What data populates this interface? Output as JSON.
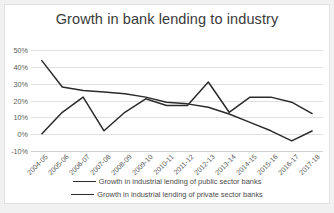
{
  "chart_data": {
    "type": "line",
    "title": "Growth in bank lending to industry",
    "xlabel": "",
    "ylabel": "",
    "ylim": [
      -10,
      50
    ],
    "yticks": [
      "-10%",
      "0%",
      "10%",
      "20%",
      "30%",
      "40%",
      "50%"
    ],
    "ytick_values": [
      -10,
      0,
      10,
      20,
      30,
      40,
      50
    ],
    "grid": true,
    "legend_position": "bottom",
    "categories": [
      "2004-05",
      "2005-06",
      "2006-07",
      "2007-08",
      "2008-09",
      "2009-10",
      "2010-11",
      "2011-12",
      "2012-13",
      "2013-14",
      "2014-15",
      "2015-16",
      "2016-17",
      "2017-18"
    ],
    "series": [
      {
        "name": "Growth in industrial lending of public sector banks",
        "color": "#2b2b2b",
        "values": [
          44,
          28,
          26,
          25,
          24,
          22,
          19,
          18,
          16,
          12,
          7,
          2,
          -4,
          2
        ]
      },
      {
        "name": "Growth in industrial lending of private sector banks",
        "color": "#2b2b2b",
        "values": [
          0,
          13,
          22,
          2,
          13,
          21,
          17,
          17,
          31,
          13,
          22,
          22,
          19,
          12
        ]
      }
    ]
  },
  "legend": {
    "items": [
      "Growth in industrial lending of public sector banks",
      "Growth in industrial lending of private sector banks"
    ]
  }
}
